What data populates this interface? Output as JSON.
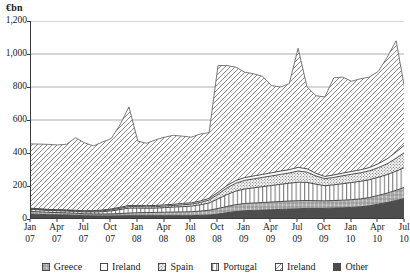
{
  "axis": {
    "unit_title": "€bn",
    "y_ticks": [
      "0",
      "200",
      "400",
      "600",
      "800",
      "1,000",
      "1,200"
    ],
    "y_min": 0,
    "y_max": 1200,
    "x_ticks": [
      {
        "month": "Jan",
        "year": "07"
      },
      {
        "month": "Apr",
        "year": "07"
      },
      {
        "month": "Jul",
        "year": "07"
      },
      {
        "month": "Oct",
        "year": "07"
      },
      {
        "month": "Jan",
        "year": "08"
      },
      {
        "month": "Apr",
        "year": "08"
      },
      {
        "month": "Jul",
        "year": "08"
      },
      {
        "month": "Oct",
        "year": "08"
      },
      {
        "month": "Jan",
        "year": "09"
      },
      {
        "month": "Apr",
        "year": "09"
      },
      {
        "month": "Jul",
        "year": "09"
      },
      {
        "month": "Oct",
        "year": "09"
      },
      {
        "month": "Jan",
        "year": "10"
      },
      {
        "month": "Apr",
        "year": "10"
      },
      {
        "month": "Jul",
        "year": "10"
      }
    ]
  },
  "legend": {
    "items": [
      {
        "label": "Greece",
        "pattern": "grey-crosshatch",
        "color": "#9a9a9a"
      },
      {
        "label": "Ireland",
        "pattern": "blank",
        "color": "#ffffff"
      },
      {
        "label": "Spain",
        "pattern": "grey-dots",
        "color": "#8e8e8e"
      },
      {
        "label": "Portugal",
        "pattern": "vertical-bars",
        "color": "#ffffff"
      },
      {
        "label": "Ireland",
        "pattern": "diagonal-hatch",
        "color": "#ffffff"
      },
      {
        "label": "Other",
        "pattern": "dark-solid",
        "color": "#4d4d4d"
      }
    ]
  },
  "chart_data": {
    "type": "area",
    "title": "",
    "subtitle": "",
    "xlabel": "",
    "ylabel": "€bn",
    "ylim": [
      0,
      1200
    ],
    "grid": true,
    "legend_position": "bottom",
    "stacked": true,
    "x": [
      "Jan 07",
      "Feb 07",
      "Mar 07",
      "Apr 07",
      "May 07",
      "Jun 07",
      "Jul 07",
      "Aug 07",
      "Sep 07",
      "Oct 07",
      "Nov 07",
      "Dec 07",
      "Jan 08",
      "Feb 08",
      "Mar 08",
      "Apr 08",
      "May 08",
      "Jun 08",
      "Jul 08",
      "Aug 08",
      "Sep 08",
      "Oct 08",
      "Nov 08",
      "Dec 08",
      "Jan 09",
      "Feb 09",
      "Mar 09",
      "Apr 09",
      "May 09",
      "Jun 09",
      "Jul 09",
      "Aug 09",
      "Sep 09",
      "Oct 09",
      "Nov 09",
      "Dec 09",
      "Jan 10",
      "Feb 10",
      "Mar 10",
      "Apr 10",
      "May 10",
      "Jun 10",
      "Jul 10"
    ],
    "series": [
      {
        "name": "Other",
        "pattern": "dark-solid",
        "values": [
          30,
          28,
          26,
          25,
          24,
          22,
          20,
          19,
          18,
          18,
          19,
          20,
          20,
          20,
          20,
          20,
          20,
          20,
          20,
          22,
          24,
          30,
          38,
          45,
          50,
          52,
          54,
          56,
          58,
          60,
          62,
          64,
          64,
          64,
          66,
          68,
          70,
          74,
          80,
          90,
          100,
          112,
          125
        ]
      },
      {
        "name": "Greece",
        "pattern": "grey-crosshatch",
        "values": [
          16,
          15,
          14,
          14,
          13,
          13,
          12,
          12,
          12,
          13,
          14,
          16,
          18,
          19,
          20,
          21,
          22,
          23,
          24,
          26,
          29,
          34,
          38,
          42,
          44,
          45,
          46,
          47,
          48,
          49,
          49,
          48,
          47,
          46,
          46,
          46,
          47,
          48,
          50,
          53,
          57,
          62,
          68
        ]
      },
      {
        "name": "Portugal",
        "pattern": "vertical-bars",
        "values": [
          12,
          12,
          11,
          11,
          11,
          11,
          11,
          12,
          14,
          18,
          24,
          30,
          28,
          26,
          26,
          28,
          30,
          32,
          34,
          38,
          44,
          58,
          72,
          82,
          88,
          92,
          96,
          100,
          104,
          108,
          112,
          110,
          100,
          92,
          95,
          100,
          104,
          106,
          108,
          110,
          112,
          116,
          120
        ]
      },
      {
        "name": "Spain",
        "pattern": "grey-dots",
        "values": [
          4,
          4,
          4,
          4,
          4,
          4,
          4,
          5,
          6,
          7,
          8,
          9,
          9,
          9,
          9,
          10,
          10,
          11,
          12,
          14,
          18,
          28,
          40,
          48,
          52,
          54,
          56,
          58,
          60,
          62,
          68,
          62,
          50,
          42,
          45,
          48,
          50,
          52,
          54,
          58,
          66,
          78,
          92
        ]
      },
      {
        "name": "Ireland",
        "pattern": "blank",
        "values": [
          3,
          3,
          3,
          3,
          3,
          3,
          3,
          3,
          4,
          5,
          6,
          7,
          7,
          7,
          7,
          7,
          7,
          8,
          8,
          9,
          10,
          12,
          14,
          16,
          17,
          18,
          18,
          19,
          20,
          20,
          22,
          20,
          16,
          14,
          15,
          16,
          17,
          18,
          20,
          24,
          30,
          38,
          46
        ]
      },
      {
        "name": "Ireland",
        "pattern": "diagonal-hatch",
        "values": [
          390,
          392,
          394,
          392,
          398,
          420,
          412,
          392,
          412,
          426,
          500,
          598,
          390,
          378,
          398,
          410,
          418,
          408,
          398,
          406,
          398,
          768,
          728,
          687,
          639,
          619,
          589,
          529,
          510,
          521,
          722,
          496,
          470,
          482,
          588,
          582,
          547,
          552,
          548,
          560,
          615,
          674,
          309
        ]
      }
    ],
    "total_top_line": [
      455,
      454,
      452,
      449,
      453,
      493,
      462,
      443,
      466,
      487,
      571,
      680,
      472,
      459,
      480,
      496,
      507,
      502,
      496,
      515,
      523,
      930,
      930,
      920,
      890,
      880,
      865,
      809,
      800,
      820,
      1035,
      800,
      747,
      740,
      855,
      860,
      835,
      850,
      860,
      895,
      980,
      1080,
      780
    ],
    "annotations": []
  }
}
